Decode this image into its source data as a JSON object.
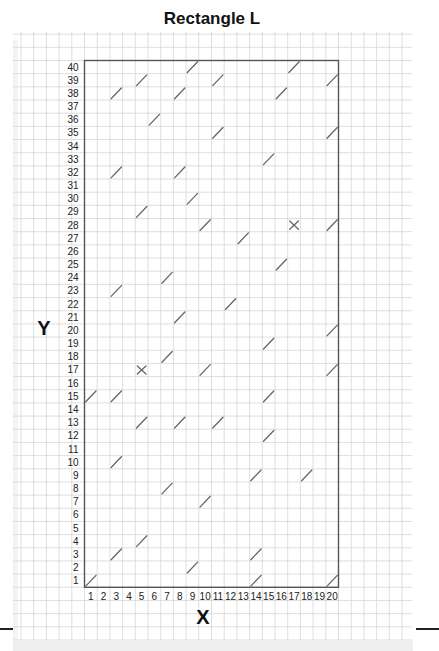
{
  "title": "Rectangle L",
  "axes": {
    "x_label": "X",
    "y_label": "Y",
    "x_ticks": [
      "1",
      "2",
      "3",
      "4",
      "5",
      "6",
      "7",
      "8",
      "9",
      "10",
      "11",
      "12",
      "13",
      "14",
      "15",
      "16",
      "17",
      "18",
      "19",
      "20"
    ],
    "y_ticks": [
      "1",
      "2",
      "3",
      "4",
      "5",
      "6",
      "7",
      "8",
      "9",
      "10",
      "11",
      "12",
      "13",
      "14",
      "15",
      "16",
      "17",
      "18",
      "19",
      "20",
      "21",
      "22",
      "23",
      "24",
      "25",
      "26",
      "27",
      "28",
      "29",
      "30",
      "31",
      "32",
      "33",
      "34",
      "35",
      "36",
      "37",
      "38",
      "39",
      "40"
    ]
  },
  "grid": {
    "columns": 20,
    "rows": 40
  },
  "colors": {
    "box_border": "#555555",
    "grid_line": "#d6d6d6",
    "mark": "#666666",
    "text": "#222222"
  },
  "marks": [
    {
      "x": 9,
      "y": 40,
      "type": "slash"
    },
    {
      "x": 17,
      "y": 40,
      "type": "slash"
    },
    {
      "x": 5,
      "y": 39,
      "type": "slash"
    },
    {
      "x": 11,
      "y": 39,
      "type": "slash"
    },
    {
      "x": 20,
      "y": 39,
      "type": "slash"
    },
    {
      "x": 3,
      "y": 38,
      "type": "slash"
    },
    {
      "x": 8,
      "y": 38,
      "type": "slash"
    },
    {
      "x": 16,
      "y": 38,
      "type": "slash"
    },
    {
      "x": 6,
      "y": 36,
      "type": "slash"
    },
    {
      "x": 11,
      "y": 35,
      "type": "slash"
    },
    {
      "x": 20,
      "y": 35,
      "type": "slash"
    },
    {
      "x": 15,
      "y": 33,
      "type": "slash"
    },
    {
      "x": 3,
      "y": 32,
      "type": "slash"
    },
    {
      "x": 8,
      "y": 32,
      "type": "slash"
    },
    {
      "x": 9,
      "y": 30,
      "type": "slash"
    },
    {
      "x": 5,
      "y": 29,
      "type": "slash"
    },
    {
      "x": 10,
      "y": 28,
      "type": "slash"
    },
    {
      "x": 17,
      "y": 28,
      "type": "cross"
    },
    {
      "x": 20,
      "y": 28,
      "type": "slash"
    },
    {
      "x": 13,
      "y": 27,
      "type": "slash"
    },
    {
      "x": 16,
      "y": 25,
      "type": "slash"
    },
    {
      "x": 7,
      "y": 24,
      "type": "slash"
    },
    {
      "x": 3,
      "y": 23,
      "type": "slash"
    },
    {
      "x": 12,
      "y": 22,
      "type": "slash"
    },
    {
      "x": 8,
      "y": 21,
      "type": "slash"
    },
    {
      "x": 20,
      "y": 20,
      "type": "slash"
    },
    {
      "x": 15,
      "y": 19,
      "type": "slash"
    },
    {
      "x": 7,
      "y": 18,
      "type": "slash"
    },
    {
      "x": 5,
      "y": 17,
      "type": "cross"
    },
    {
      "x": 10,
      "y": 17,
      "type": "slash"
    },
    {
      "x": 20,
      "y": 17,
      "type": "slash"
    },
    {
      "x": 1,
      "y": 15,
      "type": "slash"
    },
    {
      "x": 3,
      "y": 15,
      "type": "slash"
    },
    {
      "x": 15,
      "y": 15,
      "type": "slash"
    },
    {
      "x": 5,
      "y": 13,
      "type": "slash"
    },
    {
      "x": 8,
      "y": 13,
      "type": "slash"
    },
    {
      "x": 11,
      "y": 13,
      "type": "slash"
    },
    {
      "x": 15,
      "y": 12,
      "type": "slash"
    },
    {
      "x": 3,
      "y": 10,
      "type": "slash"
    },
    {
      "x": 14,
      "y": 9,
      "type": "slash"
    },
    {
      "x": 18,
      "y": 9,
      "type": "slash"
    },
    {
      "x": 7,
      "y": 8,
      "type": "slash"
    },
    {
      "x": 10,
      "y": 7,
      "type": "slash"
    },
    {
      "x": 5,
      "y": 4,
      "type": "slash"
    },
    {
      "x": 3,
      "y": 3,
      "type": "slash"
    },
    {
      "x": 14,
      "y": 3,
      "type": "slash"
    },
    {
      "x": 9,
      "y": 2,
      "type": "slash"
    },
    {
      "x": 1,
      "y": 1,
      "type": "slash"
    },
    {
      "x": 14,
      "y": 1,
      "type": "slash"
    },
    {
      "x": 20,
      "y": 1,
      "type": "slash"
    }
  ]
}
